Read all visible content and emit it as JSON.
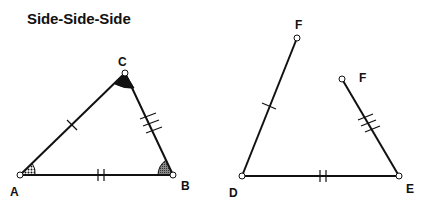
{
  "title": "Side-Side-Side",
  "colors": {
    "stroke": "#111111",
    "angle_fill": "#111111",
    "background": "#ffffff"
  },
  "figures": {
    "triangle_abc": {
      "vertices": {
        "A": {
          "label": "A",
          "x": 20,
          "y": 175
        },
        "B": {
          "label": "B",
          "x": 173,
          "y": 175
        },
        "C": {
          "label": "C",
          "x": 125,
          "y": 73
        }
      },
      "sides": [
        {
          "name": "AC",
          "ticks": 1
        },
        {
          "name": "AB",
          "ticks": 2
        },
        {
          "name": "BC",
          "ticks": 3
        }
      ],
      "angle_marks": [
        "A",
        "B",
        "C"
      ]
    },
    "segments_def": {
      "vertices": {
        "D": {
          "label": "D",
          "x": 242,
          "y": 176
        },
        "E": {
          "label": "E",
          "x": 399,
          "y": 176
        },
        "F1": {
          "label": "F",
          "x": 297,
          "y": 38
        },
        "F2": {
          "label": "F",
          "x": 342,
          "y": 79
        }
      },
      "sides": [
        {
          "name": "DF",
          "ticks": 1
        },
        {
          "name": "DE",
          "ticks": 2
        },
        {
          "name": "EF",
          "ticks": 3
        }
      ]
    }
  },
  "labels": {
    "A": "A",
    "B": "B",
    "C": "C",
    "D": "D",
    "E": "E",
    "F1": "F",
    "F2": "F"
  }
}
